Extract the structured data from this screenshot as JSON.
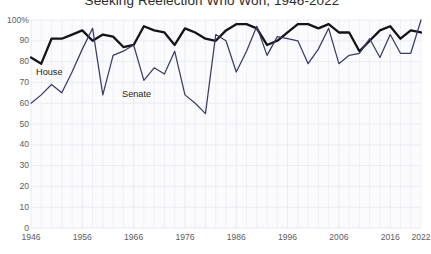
{
  "chart_data": {
    "type": "line",
    "title": "Seeking Reelection Who Won, 1946-2022",
    "xlabel": "",
    "ylabel": "",
    "ylim": [
      0,
      100
    ],
    "xlim": [
      1946,
      2022
    ],
    "grid": true,
    "legend_position": "inline-labels",
    "ytick_labels": [
      "100%",
      "90",
      "80",
      "70",
      "60",
      "50",
      "40",
      "30",
      "20",
      "10",
      "0"
    ],
    "ytick_values": [
      100,
      90,
      80,
      70,
      60,
      50,
      40,
      30,
      20,
      10,
      0
    ],
    "xtick_labels": [
      "1946",
      "1956",
      "1966",
      "1976",
      "1986",
      "1996",
      "2006",
      "2016",
      "2022"
    ],
    "xtick_values": [
      1946,
      1956,
      1966,
      1976,
      1986,
      1996,
      2006,
      2016,
      2022
    ],
    "x": [
      1946,
      1948,
      1950,
      1952,
      1954,
      1956,
      1958,
      1960,
      1962,
      1964,
      1966,
      1968,
      1970,
      1972,
      1974,
      1976,
      1978,
      1980,
      1982,
      1984,
      1986,
      1988,
      1990,
      1992,
      1994,
      1996,
      1998,
      2000,
      2002,
      2004,
      2006,
      2008,
      2010,
      2012,
      2014,
      2016,
      2018,
      2020,
      2022
    ],
    "series": [
      {
        "name": "House",
        "color": "#141418",
        "label_x": 36,
        "label_y": 68,
        "values": [
          82,
          79,
          91,
          91,
          93,
          95,
          90,
          93,
          92,
          87,
          88,
          97,
          95,
          94,
          88,
          96,
          94,
          91,
          90,
          95,
          98,
          98,
          96,
          88,
          90,
          94,
          98,
          98,
          96,
          98,
          94,
          94,
          85,
          90,
          95,
          97,
          91,
          95,
          94
        ]
      },
      {
        "name": "Senate",
        "color": "#3a3a6e",
        "label_x": 122,
        "label_y": 90,
        "values": [
          60,
          64,
          69,
          65,
          75,
          86,
          96,
          64,
          83,
          85,
          88,
          71,
          77,
          74,
          85,
          64,
          60,
          55,
          93,
          90,
          75,
          85,
          97,
          83,
          92,
          91,
          90,
          79,
          86,
          96,
          79,
          83,
          84,
          91,
          82,
          93,
          84,
          84,
          100
        ]
      }
    ]
  },
  "axis": {
    "yticks": [
      {
        "label": "100%",
        "value": 100
      },
      {
        "label": "90",
        "value": 90
      },
      {
        "label": "80",
        "value": 80
      },
      {
        "label": "70",
        "value": 70
      },
      {
        "label": "60",
        "value": 60
      },
      {
        "label": "50",
        "value": 50
      },
      {
        "label": "40",
        "value": 40
      },
      {
        "label": "30",
        "value": 30
      },
      {
        "label": "20",
        "value": 20
      },
      {
        "label": "10",
        "value": 10
      },
      {
        "label": "0",
        "value": 0
      }
    ],
    "xticks": [
      {
        "label": "1946",
        "value": 1946
      },
      {
        "label": "1956",
        "value": 1956
      },
      {
        "label": "1966",
        "value": 1966
      },
      {
        "label": "1976",
        "value": 1976
      },
      {
        "label": "1986",
        "value": 1986
      },
      {
        "label": "1996",
        "value": 1996
      },
      {
        "label": "2006",
        "value": 2006
      },
      {
        "label": "2016",
        "value": 2016
      },
      {
        "label": "2022",
        "value": 2022
      }
    ]
  },
  "colors": {
    "house_line": "#141418",
    "senate_line": "#3a3a6e",
    "grid": "#e6e8f2",
    "plot_background": "#fbfbfd",
    "axis_text": "#5c5c64",
    "title_text": "#2b2b2b"
  }
}
